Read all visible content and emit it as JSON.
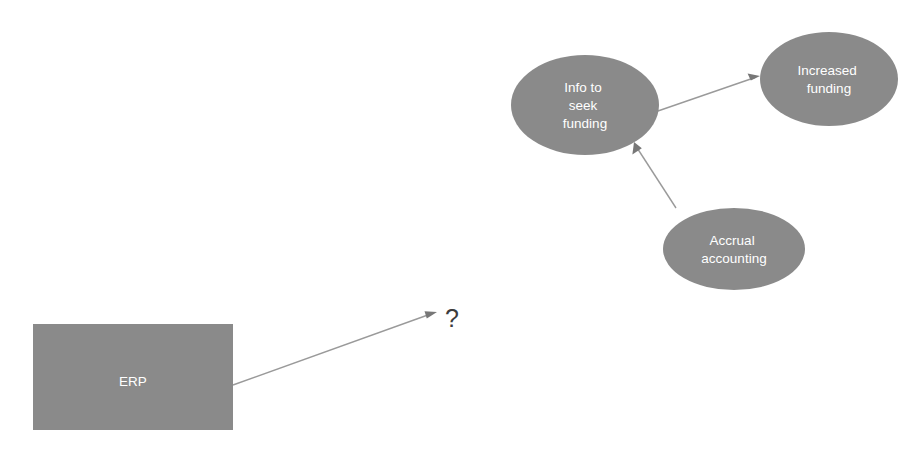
{
  "diagram": {
    "background_color": "#ffffff",
    "node_fill_color": "#8a8a8a",
    "node_text_color": "#ffffff",
    "connector_color": "#9a9a9a",
    "nodes": [
      {
        "id": "erp",
        "shape": "rectangle",
        "label": "ERP",
        "lines": [
          "ERP"
        ],
        "x": 33,
        "y": 324,
        "width": 200,
        "height": 106
      },
      {
        "id": "info-to-seek-funding",
        "shape": "ellipse",
        "label": "Info to seek funding",
        "lines": [
          "Info to",
          "seek",
          "funding"
        ],
        "cx": 585,
        "cy": 105,
        "rx": 74,
        "ry": 50
      },
      {
        "id": "increased-funding",
        "shape": "ellipse",
        "label": "Increased funding",
        "lines": [
          "Increased",
          "funding"
        ],
        "cx": 829,
        "cy": 79,
        "rx": 69,
        "ry": 47
      },
      {
        "id": "accrual-accounting",
        "shape": "ellipse",
        "label": "Accrual accounting",
        "lines": [
          "Accrual",
          "accounting"
        ],
        "cx": 734,
        "cy": 249,
        "rx": 71,
        "ry": 41
      }
    ],
    "connectors": [
      {
        "id": "erp-to-question",
        "from": "erp",
        "to": "question-mark",
        "from_point": [
          233,
          385
        ],
        "to_point": [
          437,
          312
        ]
      },
      {
        "id": "info-to-increased",
        "from": "info-to-seek-funding",
        "to": "increased-funding",
        "from_point": [
          655,
          112
        ],
        "to_point": [
          760,
          76
        ]
      },
      {
        "id": "accrual-to-info",
        "from": "accrual-accounting",
        "to": "info-to-seek-funding",
        "from_point": [
          676,
          208
        ],
        "to_point": [
          634,
          142
        ]
      }
    ],
    "annotations": [
      {
        "id": "question-mark",
        "text": "?",
        "x": 452,
        "y": 320
      }
    ]
  }
}
